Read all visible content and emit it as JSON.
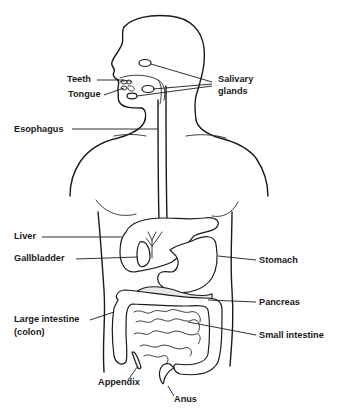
{
  "diagram": {
    "type": "anatomical-line-diagram",
    "colors": {
      "line": "#1a1a1a",
      "background": "#ffffff",
      "pancreas_fill": "#e8e8e8"
    },
    "labels": {
      "teeth": "Teeth",
      "tongue": "Tongue",
      "salivary_glands_1": "Salivary",
      "salivary_glands_2": "glands",
      "esophagus": "Esophagus",
      "liver": "Liver",
      "gallbladder": "Gallbladder",
      "stomach": "Stomach",
      "pancreas": "Pancreas",
      "large_intestine_1": "Large intestine",
      "large_intestine_2": "(colon)",
      "small_intestine": "Small intestine",
      "appendix": "Appendix",
      "anus": "Anus"
    }
  }
}
